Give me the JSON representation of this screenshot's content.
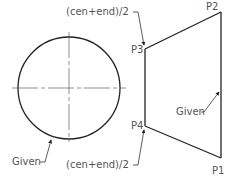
{
  "diagram": {
    "type": "cad-construction-drawing",
    "circle": {
      "center": [
        69,
        88
      ],
      "radius": 51,
      "label": "Given",
      "label_pos": [
        10,
        163
      ]
    },
    "shape": {
      "points": {
        "P1": {
          "label": "P1",
          "coord": [
            221,
            158
          ],
          "label_pos": [
            212,
            174
          ]
        },
        "P2": {
          "label": "P2",
          "coord": [
            221,
            12
          ],
          "label_pos": [
            206,
            10
          ]
        },
        "P3": {
          "label": "P3",
          "coord": [
            145,
            49
          ],
          "label_pos": [
            131,
            53
          ]
        },
        "P4": {
          "label": "P4",
          "coord": [
            145,
            126
          ],
          "label_pos": [
            131,
            129
          ]
        }
      },
      "given_edge_label": "Given",
      "given_edge_label_pos": [
        175,
        115
      ]
    },
    "annotations": {
      "top_label": "(cen+end)/2",
      "top_label_pos": [
        66,
        15
      ],
      "bottom_label": "(cen+end)/2",
      "bottom_label_pos": [
        66,
        164
      ]
    }
  }
}
